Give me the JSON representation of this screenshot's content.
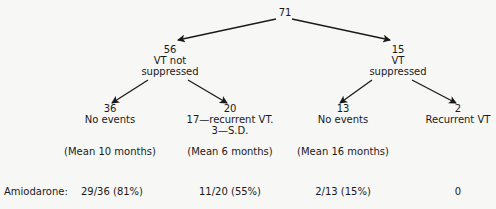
{
  "root": {
    "count": "71"
  },
  "level1": [
    {
      "count": "56",
      "line1": "VT not",
      "line2": "suppressed"
    },
    {
      "count": "15",
      "line1": "VT",
      "line2": "suppressed"
    }
  ],
  "level2": [
    {
      "count": "36",
      "line1": "No events",
      "line2": "",
      "mean": "(Mean 10 months)"
    },
    {
      "count": "20",
      "line1": "17—recurrent VT.",
      "line2": "3—S.D.",
      "mean": "(Mean 6 months)"
    },
    {
      "count": "13",
      "line1": "No events",
      "line2": "",
      "mean": "(Mean 16 months)"
    },
    {
      "count": "2",
      "line1": "Recurrent VT",
      "line2": "",
      "mean": ""
    }
  ],
  "amiodarone": {
    "label": "Amiodarone:",
    "values": [
      "29/36 (81%)",
      "11/20 (55%)",
      "2/13 (15%)",
      "0"
    ]
  },
  "colors": {
    "ink": "#1a1a1a",
    "background": "#f7f7f5"
  }
}
